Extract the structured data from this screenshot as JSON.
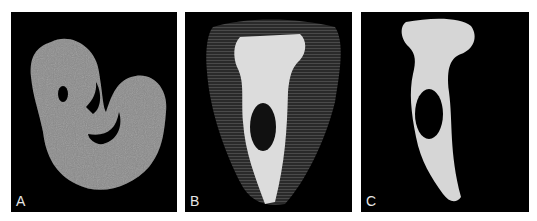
{
  "figure": {
    "panels": [
      {
        "label": "A",
        "content": "grayscale cross-section slice of cochlea, spiral shape with two dark cavities"
      },
      {
        "label": "B",
        "content": "3D volume rendering of tooth-like structure, translucent dark outer shell with bright inner canal structure and oval opening"
      },
      {
        "label": "C",
        "content": "3D surface rendering of isolated bright inner structure with oval opening"
      }
    ],
    "colors": {
      "background": "#000000",
      "slice_gray": "#8a8a8a",
      "bright_structure": "#dcdcdc",
      "shell": "#3a3a3a",
      "label": "#e6e6e6"
    }
  }
}
